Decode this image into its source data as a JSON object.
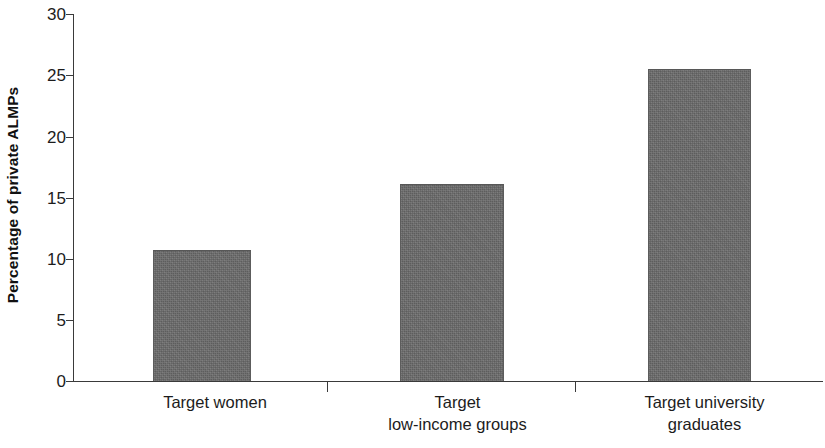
{
  "chart_data": {
    "type": "bar",
    "title": "",
    "subtitle": "",
    "xlabel": "",
    "ylabel": "Percentage of private ALMPs",
    "categories": [
      "Target women",
      "Target\nlow-income groups",
      "Target university\ngraduates"
    ],
    "category_lines": [
      [
        "Target women"
      ],
      [
        "Target",
        "low-income groups"
      ],
      [
        "Target university",
        "graduates"
      ]
    ],
    "values": [
      10.7,
      16.1,
      25.5
    ],
    "ylim": [
      0,
      30
    ],
    "ytick_values": [
      0,
      5,
      10,
      15,
      20,
      25,
      30
    ],
    "ytick_labels": [
      "0",
      "5",
      "10",
      "15",
      "20",
      "25",
      "30"
    ],
    "grid": false,
    "legend": null,
    "legend_position": "none",
    "bar_color": "#6b6b6b",
    "axis_color": "#3a3a3a",
    "background_color": "#ffffff"
  }
}
